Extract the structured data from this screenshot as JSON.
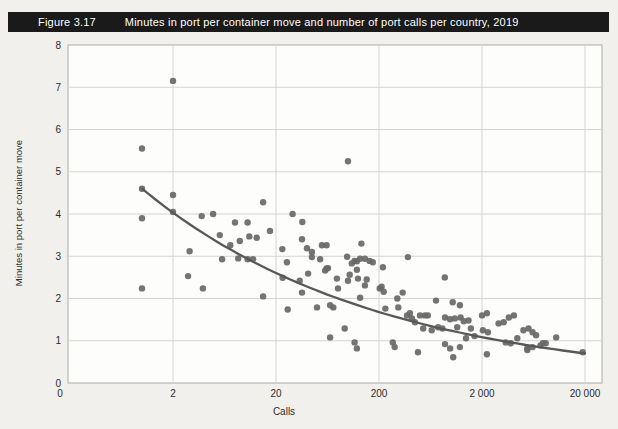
{
  "figure": {
    "label": "Figure 3.17",
    "title": "Minutes in port per container move and number of port calls per country, 2019"
  },
  "colors": {
    "title_bar_bg": "#1a1a1a",
    "title_text": "#ffffff",
    "page_bg": "#f2f0ec",
    "plot_bg": "#fdfdfb",
    "plot_border": "#aaaaa8",
    "gridline": "#d4d4d2",
    "dot": "#686868",
    "trend_line": "#585858",
    "tick_text": "#2b2b2b"
  },
  "chart_data": {
    "type": "scatter",
    "title": "Minutes in port per container move and number of port calls per country, 2019",
    "xlabel": "Calls",
    "ylabel": "Minutes in port per container move",
    "x_scale": "log",
    "ylim": [
      0,
      8
    ],
    "grid": true,
    "legend": false,
    "x_ticks": [
      {
        "label": "0",
        "value": 0
      },
      {
        "label": "2",
        "value": 2
      },
      {
        "label": "20",
        "value": 20
      },
      {
        "label": "200",
        "value": 200
      },
      {
        "label": "2 000",
        "value": 2000
      },
      {
        "label": "20 000",
        "value": 20000
      }
    ],
    "y_ticks": [
      {
        "label": "0",
        "value": 0
      },
      {
        "label": "1",
        "value": 1
      },
      {
        "label": "2",
        "value": 2
      },
      {
        "label": "3",
        "value": 3
      },
      {
        "label": "4",
        "value": 4
      },
      {
        "label": "5",
        "value": 5
      },
      {
        "label": "6",
        "value": 6
      },
      {
        "label": "7",
        "value": 7
      },
      {
        "label": "8",
        "value": 8
      }
    ],
    "trend": {
      "type": "power",
      "a": 4.6,
      "exponent": -0.19,
      "x_start": 1,
      "x_end": 20000,
      "description": "fitted trend curve, minutes = 4.6 x calls^-0.19 (≈4.6 at 1 call, ≈0.7 at 20 000 calls)"
    },
    "points": [
      [
        2,
        7.15
      ],
      [
        1,
        5.55
      ],
      [
        100,
        5.25
      ],
      [
        1,
        4.6
      ],
      [
        2,
        4.45
      ],
      [
        15,
        4.28
      ],
      [
        2,
        4.05
      ],
      [
        4.9,
        4.0
      ],
      [
        3.8,
        3.95
      ],
      [
        29,
        4.0
      ],
      [
        1,
        3.9
      ],
      [
        8,
        3.8
      ],
      [
        10.6,
        3.8
      ],
      [
        36,
        3.81
      ],
      [
        5.7,
        3.5
      ],
      [
        17.5,
        3.6
      ],
      [
        8.9,
        3.36
      ],
      [
        11,
        3.47
      ],
      [
        13,
        3.44
      ],
      [
        7.2,
        3.26
      ],
      [
        35.8,
        3.4
      ],
      [
        40,
        3.19
      ],
      [
        44.6,
        3.1
      ],
      [
        55.8,
        3.26
      ],
      [
        62,
        3.26
      ],
      [
        135,
        3.3
      ],
      [
        2.9,
        3.12
      ],
      [
        23,
        3.17
      ],
      [
        6,
        2.93
      ],
      [
        8.6,
        2.95
      ],
      [
        10.6,
        2.93
      ],
      [
        12,
        2.93
      ],
      [
        44.6,
        2.98
      ],
      [
        53.6,
        2.93
      ],
      [
        98,
        2.99
      ],
      [
        109,
        2.83
      ],
      [
        116,
        2.89
      ],
      [
        122,
        2.88
      ],
      [
        131,
        2.94
      ],
      [
        146,
        2.94
      ],
      [
        162,
        2.89
      ],
      [
        174,
        2.86
      ],
      [
        218,
        2.74
      ],
      [
        382,
        2.98
      ],
      [
        25.5,
        2.86
      ],
      [
        62,
        2.71
      ],
      [
        60,
        2.66
      ],
      [
        64,
        2.72
      ],
      [
        2.8,
        2.53
      ],
      [
        23.2,
        2.49
      ],
      [
        41,
        2.59
      ],
      [
        34,
        2.42
      ],
      [
        35.8,
        2.14
      ],
      [
        78,
        2.47
      ],
      [
        80,
        2.24
      ],
      [
        100,
        2.42
      ],
      [
        104,
        2.56
      ],
      [
        122,
        2.68
      ],
      [
        125,
        2.47
      ],
      [
        131,
        2.02
      ],
      [
        146,
        2.31
      ],
      [
        152,
        2.45
      ],
      [
        1,
        2.24
      ],
      [
        3.9,
        2.24
      ],
      [
        15,
        2.05
      ],
      [
        26,
        1.74
      ],
      [
        203,
        2.24
      ],
      [
        212,
        2.28
      ],
      [
        222,
        2.16
      ],
      [
        231,
        1.76
      ],
      [
        301,
        2.0
      ],
      [
        308,
        1.79
      ],
      [
        340,
        2.14
      ],
      [
        374,
        1.6
      ],
      [
        399,
        1.65
      ],
      [
        418,
        1.53
      ],
      [
        447,
        1.44
      ],
      [
        500,
        1.6
      ],
      [
        558,
        1.6
      ],
      [
        595,
        1.6
      ],
      [
        537,
        1.29
      ],
      [
        650,
        1.25
      ],
      [
        870,
        2.5
      ],
      [
        1040,
        1.91
      ],
      [
        1090,
        1.53
      ],
      [
        50,
        1.79
      ],
      [
        67,
        1.84
      ],
      [
        72,
        1.79
      ],
      [
        67,
        1.08
      ],
      [
        93,
        1.29
      ],
      [
        116,
        0.96
      ],
      [
        122,
        0.82
      ],
      [
        272,
        0.96
      ],
      [
        284,
        0.85
      ],
      [
        478,
        0.73
      ],
      [
        716,
        1.95
      ],
      [
        1220,
        1.84
      ],
      [
        875,
        1.55
      ],
      [
        980,
        1.51
      ],
      [
        1240,
        1.55
      ],
      [
        1330,
        1.46
      ],
      [
        1480,
        1.48
      ],
      [
        750,
        1.32
      ],
      [
        825,
        1.29
      ],
      [
        1150,
        1.32
      ],
      [
        1560,
        1.29
      ],
      [
        1690,
        1.11
      ],
      [
        1400,
        1.06
      ],
      [
        1220,
        0.85
      ],
      [
        980,
        0.82
      ],
      [
        875,
        0.92
      ],
      [
        1050,
        0.61
      ],
      [
        2000,
        1.6
      ],
      [
        2230,
        1.65
      ],
      [
        2040,
        1.25
      ],
      [
        2280,
        1.2
      ],
      [
        2230,
        0.68
      ],
      [
        2900,
        1.41
      ],
      [
        3250,
        1.44
      ],
      [
        3640,
        1.55
      ],
      [
        4080,
        1.6
      ],
      [
        3400,
        0.96
      ],
      [
        3800,
        0.94
      ],
      [
        4400,
        1.06
      ],
      [
        5050,
        1.25
      ],
      [
        5650,
        1.29
      ],
      [
        6200,
        1.2
      ],
      [
        6700,
        1.13
      ],
      [
        5500,
        0.82
      ],
      [
        6200,
        0.85
      ],
      [
        7400,
        0.89
      ],
      [
        8300,
        0.94
      ],
      [
        7800,
        0.94
      ],
      [
        5500,
        0.78
      ],
      [
        10500,
        1.08
      ],
      [
        19000,
        0.73
      ]
    ]
  }
}
